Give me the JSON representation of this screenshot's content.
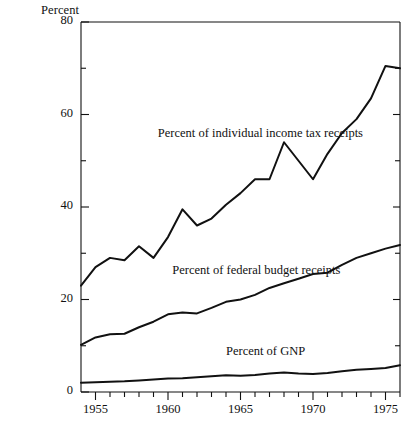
{
  "chart_data": {
    "type": "line",
    "title": "",
    "xlabel": "",
    "ylabel": "Percent",
    "xlim": [
      1954,
      1976
    ],
    "ylim": [
      0,
      80
    ],
    "grid": false,
    "legend_position": "inline-annotations",
    "y_ticks_major": [
      0,
      20,
      40,
      60,
      80
    ],
    "y_ticks_minor": [
      10,
      30,
      50,
      70
    ],
    "x_ticks_major": [
      1955,
      1960,
      1965,
      1970,
      1975
    ],
    "x_ticks_minor": [
      1956,
      1957,
      1958,
      1959,
      1961,
      1962,
      1963,
      1964,
      1966,
      1967,
      1968,
      1969,
      1971,
      1972,
      1973,
      1974,
      1976
    ],
    "x": [
      1954,
      1955,
      1956,
      1957,
      1958,
      1959,
      1960,
      1961,
      1962,
      1963,
      1964,
      1965,
      1966,
      1967,
      1968,
      1969,
      1970,
      1971,
      1972,
      1973,
      1974,
      1975,
      1976
    ],
    "series": [
      {
        "name": "Percent of individual income tax receipts",
        "values": [
          23.0,
          27.0,
          29.0,
          28.5,
          31.5,
          29.0,
          33.5,
          39.5,
          36.0,
          37.5,
          40.5,
          43.0,
          46.0,
          46.0,
          54.0,
          50.0,
          46.0,
          51.5,
          56.0,
          59.0,
          63.5,
          70.5,
          70.0
        ]
      },
      {
        "name": "Percent of federal budget receipts",
        "values": [
          10.2,
          11.8,
          12.5,
          12.6,
          14.0,
          15.2,
          16.8,
          17.2,
          17.0,
          18.2,
          19.5,
          20.0,
          21.0,
          22.5,
          23.5,
          24.5,
          25.5,
          25.8,
          27.5,
          29.0,
          30.0,
          31.0,
          31.8
        ]
      },
      {
        "name": "Percent of GNP",
        "values": [
          2.0,
          2.1,
          2.2,
          2.3,
          2.5,
          2.7,
          2.9,
          3.0,
          3.2,
          3.4,
          3.6,
          3.5,
          3.7,
          4.0,
          4.2,
          4.0,
          3.9,
          4.1,
          4.5,
          4.8,
          5.0,
          5.2,
          5.8
        ]
      }
    ],
    "annotations": [
      {
        "text": "Percent of individual income tax receipts",
        "x": 1959.3,
        "y": 55.5
      },
      {
        "text": "Percent of federal budget receipts",
        "x": 1960.3,
        "y": 26.0
      },
      {
        "text": "Percent of GNP",
        "x": 1964.0,
        "y": 8.5
      }
    ],
    "axis_color": "#111111",
    "line_color": "#111111"
  }
}
